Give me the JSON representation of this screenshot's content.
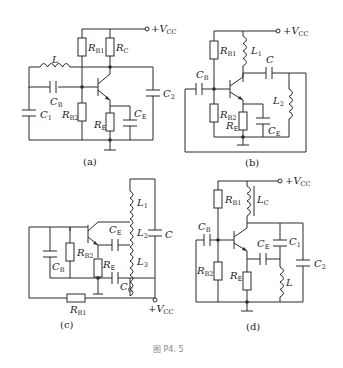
{
  "figure": {
    "caption": "图 P4. 5",
    "subfigures": [
      {
        "id": "a",
        "label": "(a)",
        "supply": "+V",
        "supply_sub": "CC",
        "components": [
          {
            "sym": "R",
            "sub": "B1"
          },
          {
            "sym": "R",
            "sub": "C"
          },
          {
            "sym": "L",
            "sub": ""
          },
          {
            "sym": "C",
            "sub": "B"
          },
          {
            "sym": "C",
            "sub": "1"
          },
          {
            "sym": "R",
            "sub": "B2"
          },
          {
            "sym": "R",
            "sub": "E"
          },
          {
            "sym": "C",
            "sub": "E"
          },
          {
            "sym": "C",
            "sub": "2"
          }
        ]
      },
      {
        "id": "b",
        "label": "(b)",
        "supply": "+V",
        "supply_sub": "CC",
        "components": [
          {
            "sym": "R",
            "sub": "B1"
          },
          {
            "sym": "L",
            "sub": "1"
          },
          {
            "sym": "C",
            "sub": ""
          },
          {
            "sym": "C",
            "sub": "B"
          },
          {
            "sym": "L",
            "sub": "2"
          },
          {
            "sym": "R",
            "sub": "B2"
          },
          {
            "sym": "R",
            "sub": "E"
          },
          {
            "sym": "C",
            "sub": "E"
          }
        ]
      },
      {
        "id": "c",
        "label": "(c)",
        "supply": "+V",
        "supply_sub": "CC",
        "components": [
          {
            "sym": "L",
            "sub": "1"
          },
          {
            "sym": "L",
            "sub": "2"
          },
          {
            "sym": "L",
            "sub": "3"
          },
          {
            "sym": "C",
            "sub": ""
          },
          {
            "sym": "C",
            "sub": "E"
          },
          {
            "sym": "C",
            "sub": "B"
          },
          {
            "sym": "R",
            "sub": "B2"
          },
          {
            "sym": "R",
            "sub": "E"
          },
          {
            "sym": "C",
            "sub": "C"
          },
          {
            "sym": "R",
            "sub": "B1"
          }
        ]
      },
      {
        "id": "d",
        "label": "(d)",
        "supply": "+V",
        "supply_sub": "CC",
        "components": [
          {
            "sym": "R",
            "sub": "B1"
          },
          {
            "sym": "L",
            "sub": "C"
          },
          {
            "sym": "C",
            "sub": "B"
          },
          {
            "sym": "C",
            "sub": "E"
          },
          {
            "sym": "C",
            "sub": "1"
          },
          {
            "sym": "C",
            "sub": "2"
          },
          {
            "sym": "R",
            "sub": "B2"
          },
          {
            "sym": "R",
            "sub": "E"
          },
          {
            "sym": "L",
            "sub": ""
          }
        ]
      }
    ]
  }
}
